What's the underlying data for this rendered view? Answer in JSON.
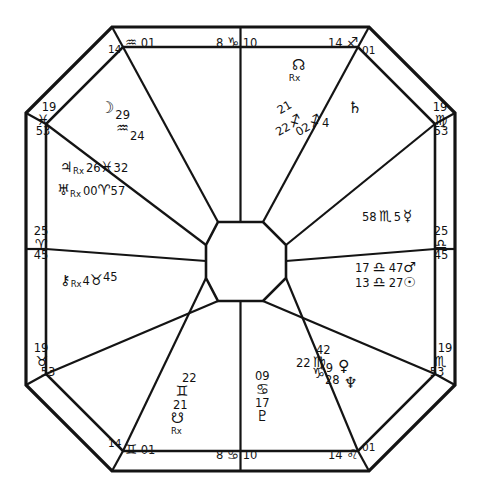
{
  "chart": {
    "kind": "astrological-natal-chart-wheel",
    "shape": "octagon",
    "title": "",
    "glyphs": {
      "aries": "♈",
      "taurus": "♉",
      "gemini": "♊",
      "cancer": "♋",
      "leo": "♌",
      "virgo": "♍",
      "libra": "♎",
      "scorpio": "♏",
      "sagittarius": "♐",
      "capricorn": "♑",
      "aquarius": "♒",
      "pisces": "♓",
      "sun": "☉",
      "moon": "☽",
      "mercury": "☿",
      "venus": "♀",
      "mars": "♂",
      "jupiter": "♃",
      "saturn": "♄",
      "uranus": "♅",
      "neptune": "♆",
      "pluto": "♇",
      "north_node": "☊",
      "south_node": "☋",
      "chiron": "⚷",
      "retrograde": "Rx"
    },
    "cusps": {
      "top": [
        {
          "name": "cusp-aquarius-top-left",
          "deg": "14",
          "sign": "♒",
          "min": "01"
        },
        {
          "name": "cusp-capricorn-top-mid",
          "deg": "8",
          "sign": "♑",
          "min": "10"
        },
        {
          "name": "cusp-sagittarius-top-right",
          "deg": "14",
          "sign": "♐",
          "min": "01"
        }
      ],
      "bottom": [
        {
          "name": "cusp-gemini-bottom-left",
          "deg": "14",
          "sign": "♊",
          "min": "01"
        },
        {
          "name": "cusp-cancer-bottom-mid",
          "deg": "8",
          "sign": "♋",
          "min": "10"
        },
        {
          "name": "cusp-leo-bottom-right",
          "deg": "14",
          "sign": "♌",
          "min": "01"
        }
      ],
      "left": [
        {
          "name": "cusp-pisces-left-top",
          "deg": "19",
          "sign": "♓",
          "min": "53"
        },
        {
          "name": "cusp-aries-left-mid",
          "deg": "25",
          "sign": "♈",
          "min": "45"
        },
        {
          "name": "cusp-taurus-left-bottom",
          "deg": "19",
          "sign": "♉",
          "min": "53"
        }
      ],
      "right": [
        {
          "name": "cusp-virgo-right-top",
          "deg": "19",
          "sign": "♍",
          "min": "53"
        },
        {
          "name": "cusp-libra-right-mid",
          "deg": "25",
          "sign": "♎",
          "min": "45"
        },
        {
          "name": "cusp-scorpio-right-bottom",
          "deg": "19",
          "sign": "♏",
          "min": "53"
        }
      ]
    },
    "planets": [
      {
        "name": "planet-moon",
        "glyph": "☽",
        "deg": "29",
        "sign": "♒",
        "min": "24",
        "retro": false,
        "label": "Moon 29 Aquarius 24"
      },
      {
        "name": "planet-jupiter",
        "glyph": "♃",
        "deg": "26",
        "sign": "♓",
        "min": "32",
        "retro": true,
        "label": "Jupiter Rx 26 Pisces 32"
      },
      {
        "name": "planet-uranus",
        "glyph": "♅",
        "deg": "00",
        "sign": "♈",
        "min": "57",
        "retro": true,
        "label": "Uranus Rx 00 Aries 57"
      },
      {
        "name": "planet-chiron",
        "glyph": "⚷",
        "deg": "4",
        "sign": "♉",
        "min": "45",
        "retro": true,
        "label": "Chiron Rx 4 Taurus 45"
      },
      {
        "name": "planet-south-node",
        "glyph": "☋",
        "deg": "21",
        "sign": "♊",
        "min": "22",
        "retro": true,
        "label": "South Node Rx 21 Gemini 22"
      },
      {
        "name": "planet-pluto",
        "glyph": "♇",
        "deg": "17",
        "sign": "♋",
        "min": "09",
        "retro": false,
        "label": "Pluto 17 Cancer 09"
      },
      {
        "name": "planet-venus",
        "glyph": "♀",
        "deg": "9",
        "sign": "♍",
        "min": "42",
        "retro": false,
        "label": "Venus 9 Virgo 42"
      },
      {
        "name": "planet-neptune",
        "glyph": "♆",
        "deg": "28",
        "sign": "♑",
        "min": "22",
        "retro": false,
        "label": "Neptune 28 Capricorn 22"
      },
      {
        "name": "planet-mars",
        "glyph": "♂",
        "deg": "17",
        "sign": "♎",
        "min": "47",
        "retro": false,
        "label": "Mars 17 Libra 47"
      },
      {
        "name": "planet-sun",
        "glyph": "☉",
        "deg": "13",
        "sign": "♎",
        "min": "27",
        "retro": false,
        "label": "Sun 13 Libra 27"
      },
      {
        "name": "planet-mercury",
        "glyph": "☿",
        "deg": "5",
        "sign": "♏",
        "min": "58",
        "retro": false,
        "label": "Mercury 5 Scorpio 58"
      },
      {
        "name": "planet-saturn",
        "glyph": "♄",
        "deg": "4",
        "sign": "♐",
        "min": "02",
        "retro": false,
        "label": "Saturn 4 Sagittarius 02"
      },
      {
        "name": "planet-north-node",
        "glyph": "☊",
        "deg": "21",
        "sign": "♐",
        "min": "22",
        "retro": true,
        "label": "North Node Rx 21 Sagittarius 22"
      }
    ],
    "colors": {
      "ink": "#141414",
      "paper": "#ffffff"
    }
  }
}
